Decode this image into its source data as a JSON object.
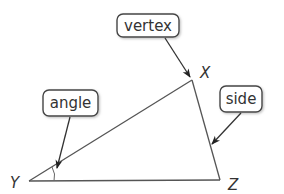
{
  "diagram": {
    "type": "labeled-triangle",
    "vertices": [
      {
        "name": "X",
        "x": 192,
        "y": 80,
        "label_x": 201,
        "label_y": 78
      },
      {
        "name": "Y",
        "x": 29,
        "y": 181,
        "label_x": 11,
        "label_y": 187
      },
      {
        "name": "Z",
        "x": 220,
        "y": 180,
        "label_x": 228,
        "label_y": 190
      }
    ],
    "callouts": [
      {
        "text": "vertex",
        "target": "X",
        "box": {
          "x": 117,
          "y": 14,
          "w": 62,
          "h": 23
        },
        "arrow": {
          "x1": 165,
          "y1": 38,
          "x2": 190,
          "y2": 77
        }
      },
      {
        "text": "angle",
        "target": "angle Y",
        "box": {
          "x": 43,
          "y": 90,
          "w": 55,
          "h": 26
        },
        "arrow": {
          "x1": 70,
          "y1": 117,
          "x2": 57,
          "y2": 168
        }
      },
      {
        "text": "side",
        "target": "side XZ",
        "box": {
          "x": 220,
          "y": 86,
          "w": 42,
          "h": 26
        },
        "arrow": {
          "x1": 241,
          "y1": 113,
          "x2": 212,
          "y2": 144
        }
      }
    ],
    "colors": {
      "stroke": "#555555",
      "text": "#333333",
      "background": "#ffffff"
    }
  }
}
